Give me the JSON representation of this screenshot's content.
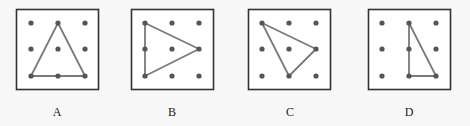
{
  "figure": {
    "colors": {
      "background": "#f7f7f7",
      "panel_fill": "#ffffff",
      "panel_border": "#333333",
      "dot": "#555555",
      "triangle_stroke": "#7a7a7a"
    },
    "grid": {
      "rows": 3,
      "cols": 3
    },
    "panels": [
      {
        "label": "A",
        "box": {
          "x": 16.5,
          "y": 9.5,
          "w": 82,
          "h": 80
        },
        "grid_x": [
          31,
          58,
          85
        ],
        "grid_y": [
          23,
          49,
          76
        ],
        "triangle_grid_points": [
          [
            1,
            0
          ],
          [
            0,
            2
          ],
          [
            2,
            2
          ]
        ],
        "triangle_desc": "isosceles triangle: apex top-middle, base along bottom row"
      },
      {
        "label": "B",
        "box": {
          "x": 131.5,
          "y": 9.5,
          "w": 82,
          "h": 80
        },
        "grid_x": [
          145,
          172,
          199
        ],
        "grid_y": [
          23,
          49,
          76
        ],
        "triangle_grid_points": [
          [
            0,
            0
          ],
          [
            2,
            1
          ],
          [
            0,
            2
          ]
        ],
        "triangle_desc": "isosceles triangle: vertical left side, apex at right-middle"
      },
      {
        "label": "C",
        "box": {
          "x": 248.5,
          "y": 9.5,
          "w": 82,
          "h": 80
        },
        "grid_x": [
          262,
          289,
          316
        ],
        "grid_y": [
          23,
          49,
          76
        ],
        "triangle_grid_points": [
          [
            0,
            0
          ],
          [
            2,
            1
          ],
          [
            1,
            2
          ]
        ],
        "triangle_desc": "scalene triangle: top-left, right-middle, bottom-middle"
      },
      {
        "label": "D",
        "box": {
          "x": 368.5,
          "y": 9.5,
          "w": 82,
          "h": 80
        },
        "grid_x": [
          382,
          409,
          436
        ],
        "grid_y": [
          23,
          49,
          76
        ],
        "triangle_grid_points": [
          [
            1,
            0
          ],
          [
            1,
            2
          ],
          [
            2,
            2
          ]
        ],
        "triangle_desc": "right triangle: top-middle, bottom-middle, bottom-right"
      }
    ]
  }
}
